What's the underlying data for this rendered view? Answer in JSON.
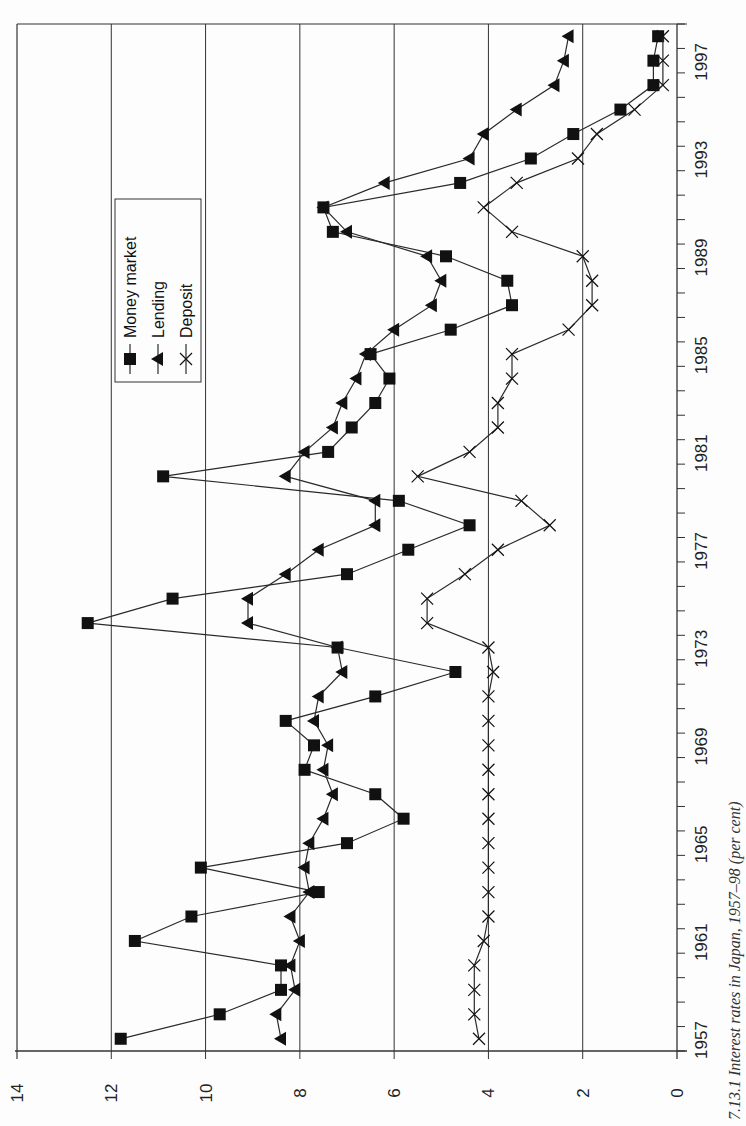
{
  "figure": {
    "caption": "7.13.1 Interest rates in Japan, 1957–98 (per cent)",
    "orientation": "rotated-90-ccw"
  },
  "legend": {
    "items": [
      {
        "label": "Money market",
        "marker": "square"
      },
      {
        "label": "Lending",
        "marker": "triangle"
      },
      {
        "label": "Deposit",
        "marker": "x"
      }
    ]
  },
  "colors": {
    "line": "#2a2a2a",
    "marker": "#111111",
    "grid": "#333333",
    "background": "#fdfdfd"
  },
  "chart_data": {
    "type": "line",
    "title": "Interest rates in Japan, 1957–98 (per cent)",
    "xlabel": "",
    "ylabel": "",
    "ylim": [
      0,
      14
    ],
    "yticks": [
      0,
      2,
      4,
      6,
      8,
      10,
      12,
      14
    ],
    "xtick_labels": [
      "1957",
      "1961",
      "1965",
      "1969",
      "1973",
      "1977",
      "1981",
      "1985",
      "1989",
      "1993",
      "1997"
    ],
    "grid": true,
    "legend_position": "upper-left (rotated view)",
    "x": [
      1957,
      1958,
      1959,
      1960,
      1961,
      1962,
      1963,
      1964,
      1965,
      1966,
      1967,
      1968,
      1969,
      1970,
      1971,
      1972,
      1973,
      1974,
      1975,
      1976,
      1977,
      1978,
      1979,
      1980,
      1981,
      1982,
      1983,
      1984,
      1985,
      1986,
      1987,
      1988,
      1989,
      1990,
      1991,
      1992,
      1993,
      1994,
      1995,
      1996,
      1997,
      1998
    ],
    "series": [
      {
        "name": "Money market",
        "marker": "square",
        "values": [
          11.8,
          9.7,
          8.4,
          8.4,
          11.5,
          10.3,
          7.6,
          10.1,
          7.0,
          5.8,
          6.4,
          7.9,
          7.7,
          8.3,
          6.4,
          4.7,
          7.2,
          12.5,
          10.7,
          7.0,
          5.7,
          4.4,
          5.9,
          10.9,
          7.4,
          6.9,
          6.4,
          6.1,
          6.5,
          4.8,
          3.5,
          3.6,
          4.9,
          7.3,
          7.5,
          4.6,
          3.1,
          2.2,
          1.2,
          0.5,
          0.5,
          0.4
        ]
      },
      {
        "name": "Lending",
        "marker": "triangle",
        "values": [
          8.4,
          8.5,
          8.1,
          8.2,
          8.0,
          8.2,
          7.8,
          7.9,
          7.8,
          7.5,
          7.3,
          7.5,
          7.4,
          7.7,
          7.6,
          7.1,
          7.2,
          9.1,
          9.1,
          8.3,
          7.6,
          6.4,
          6.4,
          8.3,
          7.9,
          7.3,
          7.1,
          6.8,
          6.6,
          6.0,
          5.2,
          5.0,
          5.3,
          7.0,
          7.5,
          6.2,
          4.4,
          4.1,
          3.4,
          2.6,
          2.4,
          2.3
        ]
      },
      {
        "name": "Deposit",
        "marker": "x",
        "values": [
          4.2,
          4.3,
          4.3,
          4.3,
          4.1,
          4.0,
          4.0,
          4.0,
          4.0,
          4.0,
          4.0,
          4.0,
          4.0,
          4.0,
          4.0,
          3.9,
          4.0,
          5.3,
          5.3,
          4.5,
          3.8,
          2.7,
          3.3,
          5.5,
          4.4,
          3.8,
          3.8,
          3.5,
          3.5,
          2.3,
          1.8,
          1.8,
          2.0,
          3.5,
          4.1,
          3.4,
          2.1,
          1.7,
          0.9,
          0.3,
          0.3,
          0.3
        ]
      }
    ]
  }
}
